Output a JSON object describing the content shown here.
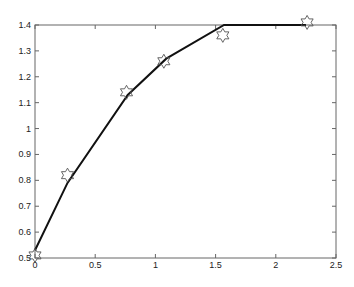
{
  "chart_data": {
    "type": "line",
    "title": "",
    "xlabel": "",
    "ylabel": "",
    "xlim": [
      0,
      2.5
    ],
    "ylim": [
      0.5,
      1.4
    ],
    "grid": false,
    "legend": null,
    "x_ticks": [
      "0",
      "0.5",
      "1",
      "1.5",
      "2",
      "2.5"
    ],
    "y_ticks": [
      "0.5",
      "0.6",
      "0.7",
      "0.8",
      "0.9",
      "1",
      "1.1",
      "1.2",
      "1.3",
      "1.4"
    ],
    "series": [
      {
        "name": "fitted line",
        "style": "solid black line",
        "x": [
          0.0,
          0.27,
          0.77,
          1.09,
          1.57,
          2.25
        ],
        "y": [
          0.53,
          0.79,
          1.13,
          1.27,
          1.4,
          1.4
        ]
      },
      {
        "name": "data points",
        "style": "hexagram (six-point star) markers, unfilled",
        "x": [
          0.0,
          0.27,
          0.76,
          1.07,
          1.56,
          2.26
        ],
        "y": [
          0.51,
          0.82,
          1.14,
          1.26,
          1.36,
          1.41
        ]
      }
    ]
  },
  "colors": {
    "line": "#111111",
    "marker": "#555555",
    "axes": "#666666",
    "background": "#ffffff"
  }
}
